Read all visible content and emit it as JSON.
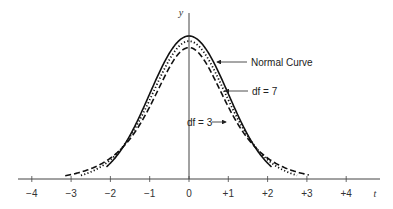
{
  "chart_data": {
    "type": "line",
    "title": "",
    "xlabel": "t",
    "ylabel": "y",
    "xlim": [
      -4.4,
      4.9
    ],
    "ylim": [
      0,
      0.42
    ],
    "xticks": [
      -4,
      -3,
      -2,
      -1,
      0,
      1,
      2,
      3,
      4
    ],
    "xtick_labels": [
      "−4",
      "−3",
      "−2",
      "−1",
      "0",
      "+1",
      "+2",
      "+3",
      "+4"
    ],
    "grid": false,
    "series": [
      {
        "name": "Normal Curve",
        "style": "solid",
        "df": null,
        "x_range": [
          -2.1,
          2.1
        ]
      },
      {
        "name": "df = 7",
        "style": "dotted",
        "df": 7,
        "x_range": [
          -2.75,
          2.75
        ]
      },
      {
        "name": "df = 3",
        "style": "dashed",
        "df": 3,
        "x_range": [
          -3.15,
          3.05
        ]
      }
    ],
    "annotations": [
      {
        "text": "Normal Curve",
        "points_to": "Normal Curve",
        "arrow": "left"
      },
      {
        "text": "df = 7",
        "points_to": "df = 7",
        "arrow": "left"
      },
      {
        "text": "df = 3",
        "points_to": "df = 3",
        "arrow": "right"
      }
    ]
  }
}
